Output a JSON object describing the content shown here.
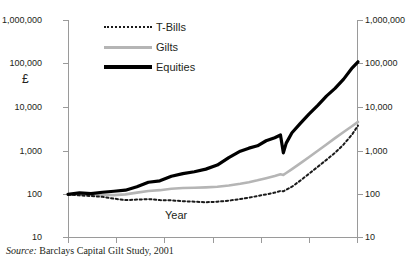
{
  "chart_data": {
    "type": "line",
    "title": "",
    "xlabel": "Year",
    "ylabel": "£",
    "yscale": "log",
    "ylim": [
      10,
      1000000
    ],
    "xlim": [
      1899,
      2000
    ],
    "grid": false,
    "legend_position": "top-left",
    "y_ticks_left": [
      "1,000,000",
      "100,000",
      "10,000",
      "1,000",
      "100",
      "10"
    ],
    "y_ticks_right": [
      "1,000,000",
      "100,000",
      "10,000",
      "1,000",
      "100",
      "10"
    ],
    "x_tick_count": 6,
    "x_tick_labels": [
      "",
      "",
      "",
      "",
      "",
      ""
    ],
    "x": [
      1899,
      1903,
      1907,
      1911,
      1915,
      1919,
      1923,
      1927,
      1931,
      1935,
      1939,
      1943,
      1947,
      1951,
      1955,
      1959,
      1962,
      1965,
      1968,
      1971,
      1973,
      1974,
      1975,
      1977,
      1980,
      1983,
      1986,
      1989,
      1992,
      1995,
      1998,
      2000
    ],
    "series": [
      {
        "name": "T-Bills",
        "style": "dotted",
        "color": "#1a1a1a",
        "values": [
          100,
          95,
          92,
          88,
          80,
          74,
          76,
          78,
          74,
          73,
          70,
          68,
          66,
          68,
          72,
          78,
          84,
          92,
          100,
          110,
          120,
          118,
          128,
          150,
          210,
          300,
          430,
          620,
          900,
          1400,
          2400,
          3800
        ]
      },
      {
        "name": "Gilts",
        "style": "solid",
        "color": "#b5b5b5",
        "values": [
          100,
          102,
          100,
          98,
          96,
          100,
          110,
          120,
          125,
          135,
          140,
          142,
          145,
          150,
          160,
          175,
          190,
          210,
          235,
          265,
          290,
          280,
          310,
          380,
          520,
          720,
          1000,
          1400,
          1950,
          2700,
          3700,
          4600
        ]
      },
      {
        "name": "Equities",
        "style": "thick",
        "color": "#000000",
        "values": [
          100,
          108,
          104,
          112,
          118,
          125,
          150,
          190,
          205,
          260,
          300,
          330,
          380,
          470,
          700,
          980,
          1150,
          1300,
          1700,
          2000,
          2300,
          900,
          1500,
          2600,
          4300,
          7000,
          11000,
          18000,
          27000,
          44000,
          80000,
          110000
        ]
      }
    ],
    "annotations": []
  },
  "legend": {
    "items": [
      {
        "label": "T-Bills",
        "key": "dotted-line-key"
      },
      {
        "label": "Gilts",
        "key": "gray-line-key"
      },
      {
        "label": "Equities",
        "key": "black-line-key"
      }
    ]
  },
  "axis": {
    "y_label": "£",
    "x_label": "Year",
    "left_ticks": [
      "1,000,000",
      "100,000",
      "10,000",
      "1,000",
      "100",
      "10"
    ],
    "right_ticks": [
      "1,000,000",
      "100,000",
      "10,000",
      "1,000",
      "100",
      "10"
    ]
  },
  "footer": {
    "source_word": "Source:",
    "source_text": " Barclays Capital Gilt Study, 2001"
  },
  "colors": {
    "equities": "#000000",
    "gilts": "#b5b5b5",
    "tbills": "#1a1a1a",
    "axis": "#9a9a9a",
    "text": "#231f20",
    "background": "#ffffff"
  }
}
